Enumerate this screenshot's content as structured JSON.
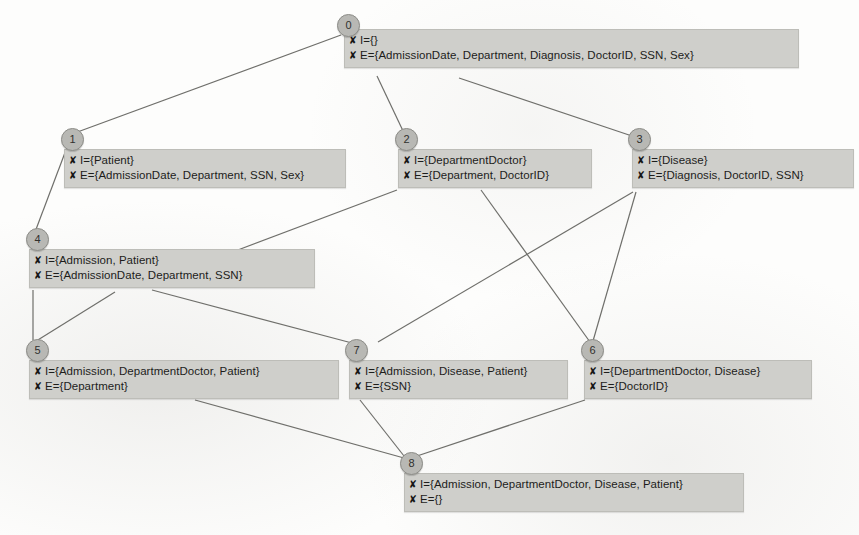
{
  "diagram": {
    "bullet_glyph": "✘",
    "colors": {
      "node_fill": "#cfcfcb",
      "circle_fill": "#b8b8b4",
      "edge": "#6f6f6b",
      "text": "#1d1d1b",
      "background": "#fdfdfc"
    },
    "nodes": [
      {
        "id": "0",
        "circle_x": 337,
        "circle_y": 14,
        "box_x": 344,
        "box_y": 29,
        "box_w": 455,
        "i_line": "I={}",
        "e_line": "E={AdmissionDate, Department, Diagnosis, DoctorID, SSN, Sex}"
      },
      {
        "id": "1",
        "circle_x": 61,
        "circle_y": 128,
        "box_x": 64,
        "box_y": 149,
        "box_w": 282,
        "i_line": "I={Patient}",
        "e_line": "E={AdmissionDate, Department, SSN, Sex}"
      },
      {
        "id": "2",
        "circle_x": 395,
        "circle_y": 128,
        "box_x": 398,
        "box_y": 149,
        "box_w": 194,
        "i_line": "I={DepartmentDoctor}",
        "e_line": "E={Department, DoctorID}"
      },
      {
        "id": "3",
        "circle_x": 628,
        "circle_y": 128,
        "box_x": 632,
        "box_y": 149,
        "box_w": 222,
        "i_line": "I={Disease}",
        "e_line": "E={Diagnosis, DoctorID, SSN}"
      },
      {
        "id": "4",
        "circle_x": 26,
        "circle_y": 228,
        "box_x": 29,
        "box_y": 249,
        "box_w": 286,
        "i_line": "I={Admission, Patient}",
        "e_line": "E={AdmissionDate, Department, SSN}"
      },
      {
        "id": "5",
        "circle_x": 26,
        "circle_y": 339,
        "box_x": 29,
        "box_y": 360,
        "box_w": 310,
        "i_line": "I={Admission, DepartmentDoctor, Patient}",
        "e_line": "E={Department}"
      },
      {
        "id": "6",
        "circle_x": 581,
        "circle_y": 339,
        "box_x": 584,
        "box_y": 360,
        "box_w": 228,
        "i_line": "I={DepartmentDoctor, Disease}",
        "e_line": "E={DoctorID}"
      },
      {
        "id": "7",
        "circle_x": 345,
        "circle_y": 339,
        "box_x": 349,
        "box_y": 360,
        "box_w": 219,
        "i_line": "I={Admission, Disease, Patient}",
        "e_line": "E={SSN}"
      },
      {
        "id": "8",
        "circle_x": 400,
        "circle_y": 452,
        "box_x": 404,
        "box_y": 473,
        "box_w": 340,
        "i_line": "I={Admission, DepartmentDoctor, Disease, Patient}",
        "e_line": "E={}"
      }
    ],
    "edges": [
      {
        "from": "0",
        "to": "1",
        "x1": 341,
        "y1": 35,
        "x2": 72,
        "y2": 134
      },
      {
        "from": "0",
        "to": "2",
        "x1": 377,
        "y1": 76,
        "x2": 404,
        "y2": 133
      },
      {
        "from": "0",
        "to": "3",
        "x1": 459,
        "y1": 78,
        "x2": 632,
        "y2": 136
      },
      {
        "from": "1",
        "to": "4",
        "x1": 66,
        "y1": 150,
        "x2": 35,
        "y2": 232
      },
      {
        "from": "2",
        "to": "4",
        "x1": 397,
        "y1": 190,
        "x2": 230,
        "y2": 253
      },
      {
        "from": "4",
        "to": "5",
        "x1": 33,
        "y1": 290,
        "x2": 33,
        "y2": 340
      },
      {
        "from": "4",
        "to": "7",
        "x1": 152,
        "y1": 290,
        "x2": 352,
        "y2": 343
      },
      {
        "from": "5",
        "to": "4",
        "x1": 33,
        "y1": 343,
        "x2": 115,
        "y2": 292
      },
      {
        "from": "2",
        "to": "6",
        "x1": 481,
        "y1": 190,
        "x2": 590,
        "y2": 342
      },
      {
        "from": "3",
        "to": "6",
        "x1": 636,
        "y1": 192,
        "x2": 593,
        "y2": 341
      },
      {
        "from": "3",
        "to": "7",
        "x1": 633,
        "y1": 192,
        "x2": 378,
        "y2": 342
      },
      {
        "from": "5",
        "to": "8",
        "x1": 195,
        "y1": 400,
        "x2": 404,
        "y2": 458
      },
      {
        "from": "7",
        "to": "8",
        "x1": 360,
        "y1": 400,
        "x2": 404,
        "y2": 456
      },
      {
        "from": "6",
        "to": "8",
        "x1": 585,
        "y1": 400,
        "x2": 414,
        "y2": 457
      }
    ]
  }
}
